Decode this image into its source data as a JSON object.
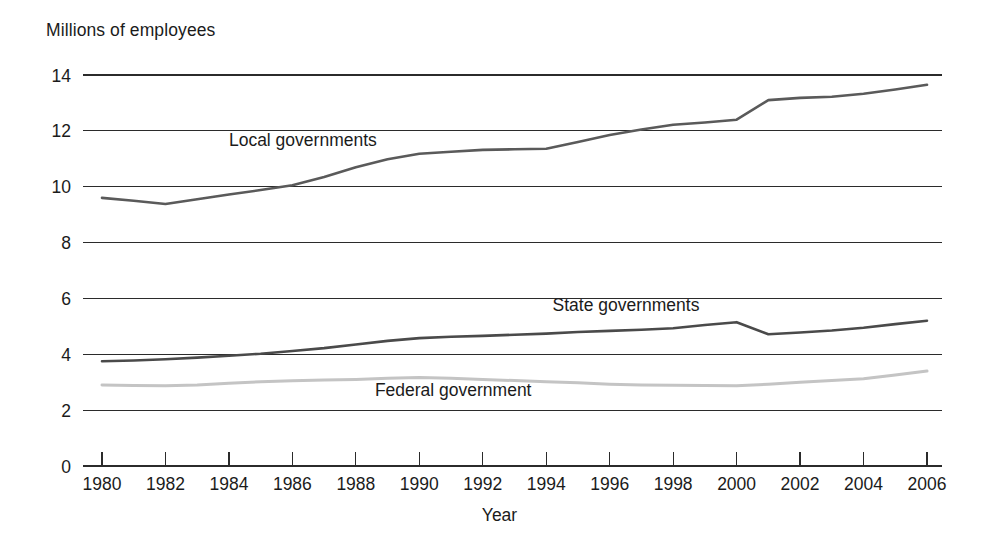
{
  "chart_data": {
    "type": "line",
    "title": "",
    "ylabel": "Millions of employees",
    "xlabel": "Year",
    "ylim": [
      0,
      14
    ],
    "xlim": [
      1980,
      2006
    ],
    "grid": true,
    "legend_position": "inline-annotations",
    "y_ticks": [
      "0",
      "2",
      "4",
      "6",
      "8",
      "10",
      "12",
      "14"
    ],
    "y_tick_values": [
      0,
      2,
      4,
      6,
      8,
      10,
      12,
      14
    ],
    "x_ticks": [
      "1980",
      "1982",
      "1984",
      "1986",
      "1988",
      "1990",
      "1992",
      "1994",
      "1996",
      "1998",
      "2000",
      "2002",
      "2004",
      "2006"
    ],
    "x_tick_values": [
      1980,
      1982,
      1984,
      1986,
      1988,
      1990,
      1992,
      1994,
      1996,
      1998,
      2000,
      2002,
      2004,
      2006
    ],
    "x": [
      1980,
      1981,
      1982,
      1983,
      1984,
      1985,
      1986,
      1987,
      1988,
      1989,
      1990,
      1991,
      1992,
      1993,
      1994,
      1995,
      1996,
      1997,
      1998,
      1999,
      2000,
      2001,
      2002,
      2003,
      2004,
      2005,
      2006
    ],
    "series": [
      {
        "name": "Local governments",
        "color": "#5a5a5a",
        "width": 2.6,
        "label_x": 1984.0,
        "label_y": 11.45,
        "values": [
          9.6,
          9.5,
          9.38,
          9.55,
          9.72,
          9.88,
          10.05,
          10.35,
          10.7,
          10.98,
          11.18,
          11.25,
          11.32,
          11.34,
          11.36,
          11.6,
          11.85,
          12.05,
          12.22,
          12.3,
          12.4,
          13.1,
          13.18,
          13.22,
          13.33,
          13.48,
          13.65
        ]
      },
      {
        "name": "State governments",
        "color": "#4a4a4a",
        "width": 2.6,
        "label_x": 1994.2,
        "label_y": 5.55,
        "values": [
          3.75,
          3.78,
          3.82,
          3.88,
          3.95,
          4.02,
          4.12,
          4.22,
          4.35,
          4.48,
          4.58,
          4.63,
          4.66,
          4.7,
          4.74,
          4.8,
          4.84,
          4.88,
          4.93,
          5.05,
          5.15,
          4.72,
          4.78,
          4.85,
          4.95,
          5.08,
          5.2
        ]
      },
      {
        "name": "Federal government",
        "color": "#c4c4c4",
        "width": 3.0,
        "label_x": 1988.6,
        "label_y": 2.52,
        "values": [
          2.9,
          2.88,
          2.87,
          2.9,
          2.96,
          3.02,
          3.05,
          3.08,
          3.1,
          3.14,
          3.17,
          3.14,
          3.1,
          3.06,
          3.02,
          2.98,
          2.93,
          2.9,
          2.89,
          2.88,
          2.87,
          2.93,
          3.0,
          3.06,
          3.12,
          3.26,
          3.4
        ]
      }
    ]
  },
  "axis": {
    "y_title": "Millions of employees",
    "x_title": "Year"
  }
}
